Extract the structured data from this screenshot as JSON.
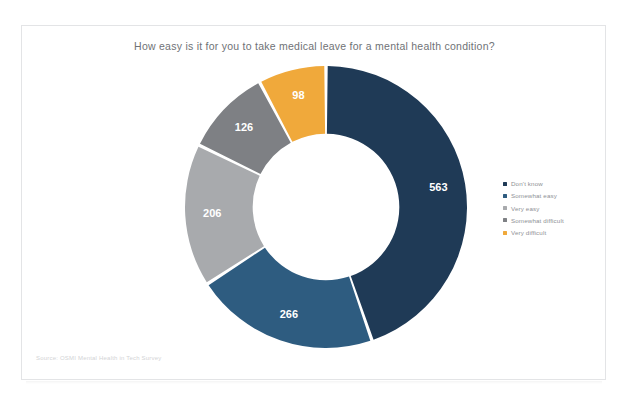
{
  "card": {
    "title": "How easy is it for you to take medical leave for a mental health condition?",
    "source": "Source: OSMI Mental Health in Tech Survey"
  },
  "legend": {
    "items": [
      {
        "label": "Don't know",
        "color": "#1F3A56"
      },
      {
        "label": "Somewhat easy",
        "color": "#2E5C80"
      },
      {
        "label": "Very easy",
        "color": "#A8AAAD"
      },
      {
        "label": "Somewhat difficult",
        "color": "#7E8084"
      },
      {
        "label": "Very difficult",
        "color": "#F0A93B"
      }
    ]
  },
  "chart_data": {
    "type": "pie",
    "title": "How easy is it for you to take medical leave for a mental health condition?",
    "subtitle": "",
    "xlabel": "",
    "ylabel": "",
    "donut": true,
    "inner_radius_ratio": 0.52,
    "start_angle_deg": 0,
    "direction": "clockwise",
    "legend_position": "right",
    "grid": false,
    "total": 1259,
    "categories": [
      "Don't know",
      "Somewhat easy",
      "Very easy",
      "Somewhat difficult",
      "Very difficult"
    ],
    "values": [
      563,
      266,
      206,
      126,
      98
    ],
    "colors": [
      "#1F3A56",
      "#2E5C80",
      "#A8AAAD",
      "#7E8084",
      "#F0A93B"
    ],
    "data_labels": [
      "563",
      "266",
      "206",
      "126",
      "98"
    ],
    "slices": [
      {
        "label": "Don't know",
        "value": 563,
        "data_label": "563",
        "color": "#1F3A56"
      },
      {
        "label": "Somewhat easy",
        "value": 266,
        "data_label": "266",
        "color": "#2E5C80"
      },
      {
        "label": "Very easy",
        "value": 206,
        "data_label": "206",
        "color": "#A8AAAD"
      },
      {
        "label": "Somewhat difficult",
        "value": 126,
        "data_label": "126",
        "color": "#7E8084"
      },
      {
        "label": "Very difficult",
        "value": 98,
        "data_label": "98",
        "color": "#F0A93B"
      }
    ]
  }
}
